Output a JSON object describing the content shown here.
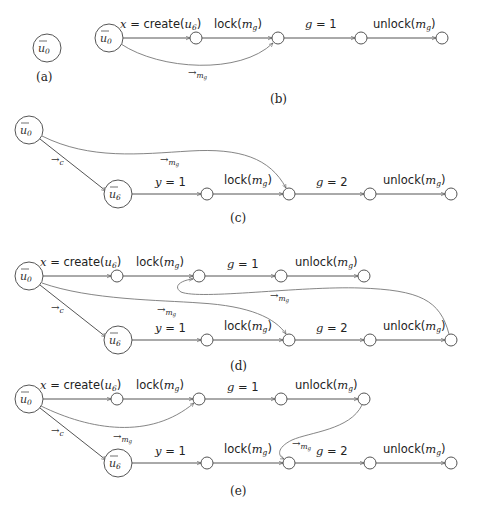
{
  "panels": {
    "a": {
      "caption": "(a)",
      "nodes": {
        "u0": "ū0"
      }
    },
    "b": {
      "caption": "(b)",
      "nodes": {
        "u0": "ū0"
      },
      "edges": [
        "x = create(u6)",
        "lock(mg)",
        "g = 1",
        "unlock(mg)"
      ],
      "sync_edges": [
        "→mg"
      ]
    },
    "c": {
      "caption": "(c)",
      "nodes": {
        "u0": "ū0",
        "u6": "ū6"
      },
      "edges": [
        "y = 1",
        "lock(mg)",
        "g = 2",
        "unlock(mg)"
      ],
      "sync_edges": [
        "→c",
        "→mg"
      ]
    },
    "d": {
      "caption": "(d)",
      "nodes": {
        "u0": "ū0",
        "u6": "ū6"
      },
      "edges_top": [
        "x = create(u6)",
        "lock(mg)",
        "g = 1",
        "unlock(mg)"
      ],
      "edges_bottom": [
        "y = 1",
        "lock(mg)",
        "g = 2",
        "unlock(mg)"
      ],
      "sync_edges": [
        "→c",
        "→mg",
        "→mg"
      ]
    },
    "e": {
      "caption": "(e)",
      "nodes": {
        "u0": "ū0",
        "u6": "ū6"
      },
      "edges_top": [
        "x = create(u6)",
        "lock(mg)",
        "g = 1",
        "unlock(mg)"
      ],
      "edges_bottom": [
        "y = 1",
        "lock(mg)",
        "g = 2",
        "unlock(mg)"
      ],
      "sync_edges": [
        "→c",
        "→mg",
        "→mg"
      ]
    }
  },
  "labels": {
    "u0": "u",
    "u0_sub": "0",
    "u6": "u",
    "u6_sub": "6",
    "create_prefix": "x",
    "create_eq": " = create(",
    "create_arg": "u",
    "create_arg_sub": "6",
    "close": ")",
    "lock": "lock(",
    "unlock": "unlock(",
    "m": "m",
    "g_sub": "g",
    "g": "g",
    "eq1": " = 1",
    "eq2": " = 2",
    "y": "y",
    "arrow": "→",
    "c": "c",
    "cap_a": "(a)",
    "cap_b": "(b)",
    "cap_c": "(c)",
    "cap_d": "(d)",
    "cap_e": "(e)"
  }
}
